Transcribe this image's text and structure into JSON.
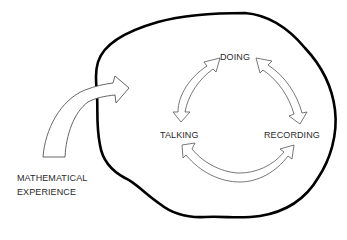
{
  "diagram": {
    "nodes": [
      {
        "id": "doing",
        "label": "DOING"
      },
      {
        "id": "talking",
        "label": "TALKING"
      },
      {
        "id": "recording",
        "label": "RECORDING"
      }
    ],
    "input": {
      "label_line1": "MATHEMATICAL",
      "label_line2": "EXPERIENCE"
    },
    "edges": [
      {
        "from": "talking",
        "to": "doing",
        "type": "bidirectional"
      },
      {
        "from": "doing",
        "to": "recording",
        "type": "bidirectional"
      },
      {
        "from": "recording",
        "to": "talking",
        "type": "bidirectional"
      },
      {
        "from": "mathematical-experience",
        "to": "cycle",
        "type": "directional"
      }
    ],
    "colors": {
      "outline": "#000000",
      "arrow_stroke": "#555555",
      "arrow_fill": "#ffffff",
      "text": "#2a2a2a"
    }
  }
}
